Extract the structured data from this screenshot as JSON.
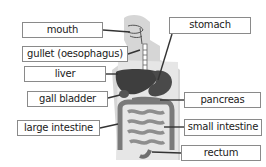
{
  "diagram": {
    "type": "labeled anatomy diagram - human digestive system",
    "colors": {
      "body_silhouette": "#d4d4d4",
      "organ_dark": "#3e3e3e",
      "organ_mid": "#6e6e6e",
      "intestine": "#8a8a8a",
      "leader_line": "#333333",
      "label_border": "#8a8a8a"
    },
    "labels_left": [
      {
        "id": "mouth",
        "text": "mouth"
      },
      {
        "id": "gullet",
        "text": "gullet (oesophagus)"
      },
      {
        "id": "liver",
        "text": "liver"
      },
      {
        "id": "gall-bladder",
        "text": "gall bladder"
      },
      {
        "id": "large-intestine",
        "text": "large intestine"
      }
    ],
    "labels_right": [
      {
        "id": "stomach",
        "text": "stomach"
      },
      {
        "id": "pancreas",
        "text": "pancreas"
      },
      {
        "id": "small-intestine",
        "text": "small intestine"
      },
      {
        "id": "rectum",
        "text": "rectum"
      }
    ]
  }
}
